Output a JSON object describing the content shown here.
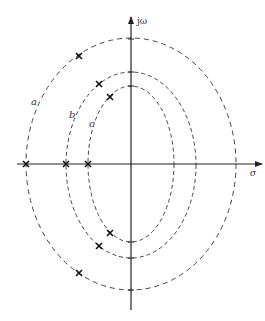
{
  "diagram": {
    "axes": {
      "vertical_label": "jω",
      "horizontal_label": "σ"
    },
    "curves": [
      {
        "id": "a",
        "label": "a",
        "rx": 105,
        "ry": 126
      },
      {
        "id": "b",
        "label": "b",
        "rx": 65,
        "ry": 93
      },
      {
        "id": "c",
        "label": "c",
        "rx": 43,
        "ry": 78
      }
    ],
    "poles": [
      {
        "curve": "a",
        "x": 79,
        "y": 56
      },
      {
        "curve": "a",
        "x": 79,
        "y": 273
      },
      {
        "curve": "a",
        "x": 26,
        "y": 164
      },
      {
        "curve": "b",
        "x": 99,
        "y": 84
      },
      {
        "curve": "b",
        "x": 99,
        "y": 246
      },
      {
        "curve": "b",
        "x": 66,
        "y": 164
      },
      {
        "curve": "c",
        "x": 110,
        "y": 97
      },
      {
        "curve": "c",
        "x": 110,
        "y": 233
      },
      {
        "curve": "c",
        "x": 88,
        "y": 164
      }
    ]
  }
}
